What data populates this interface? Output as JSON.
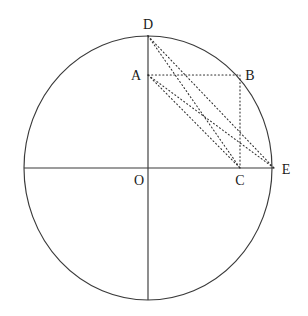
{
  "figure": {
    "type": "geometry-diagram",
    "canvas": {
      "width": 308,
      "height": 316,
      "background": "#ffffff"
    },
    "colors": {
      "stroke": "#3a3a3a",
      "dotted": "#2e2e2e",
      "label": "#1a1a1a",
      "background": "#ffffff"
    },
    "circle": {
      "name": "main-circle",
      "center_x": 148,
      "center_y": 168,
      "radius_x": 124,
      "radius_y": 132
    },
    "axes": {
      "horizontal": {
        "x1": 24,
        "y1": 168,
        "x2": 274,
        "y2": 168
      },
      "vertical": {
        "x1": 148,
        "y1": 35,
        "x2": 148,
        "y2": 300
      }
    },
    "points": [
      {
        "id": "D",
        "label": "D",
        "x": 148,
        "y": 36,
        "label_x": 148,
        "label_y": 29
      },
      {
        "id": "A",
        "label": "A",
        "x": 148,
        "y": 75,
        "label_x": 136,
        "label_y": 80
      },
      {
        "id": "B",
        "label": "B",
        "x": 240,
        "y": 75,
        "label_x": 250,
        "label_y": 80
      },
      {
        "id": "O",
        "label": "O",
        "x": 148,
        "y": 168,
        "label_x": 139,
        "label_y": 185
      },
      {
        "id": "C",
        "label": "C",
        "x": 240,
        "y": 168,
        "label_x": 240,
        "label_y": 185
      },
      {
        "id": "E",
        "label": "E",
        "x": 274,
        "y": 168,
        "label_x": 286,
        "label_y": 174
      }
    ],
    "dotted_segments": [
      {
        "id": "AB",
        "from": "A",
        "to": "B",
        "x1": 148,
        "y1": 75,
        "x2": 240,
        "y2": 75
      },
      {
        "id": "BC",
        "from": "B",
        "to": "C",
        "x1": 240,
        "y1": 75,
        "x2": 240,
        "y2": 168
      },
      {
        "id": "DC",
        "from": "D",
        "to": "C",
        "x1": 148,
        "y1": 36,
        "x2": 240,
        "y2": 168
      },
      {
        "id": "DE",
        "from": "D",
        "to": "E",
        "x1": 148,
        "y1": 36,
        "x2": 274,
        "y2": 168
      },
      {
        "id": "AC",
        "from": "A",
        "to": "C",
        "x1": 148,
        "y1": 75,
        "x2": 240,
        "y2": 168
      },
      {
        "id": "AE",
        "from": "A",
        "to": "E",
        "x1": 148,
        "y1": 75,
        "x2": 274,
        "y2": 168
      }
    ]
  }
}
